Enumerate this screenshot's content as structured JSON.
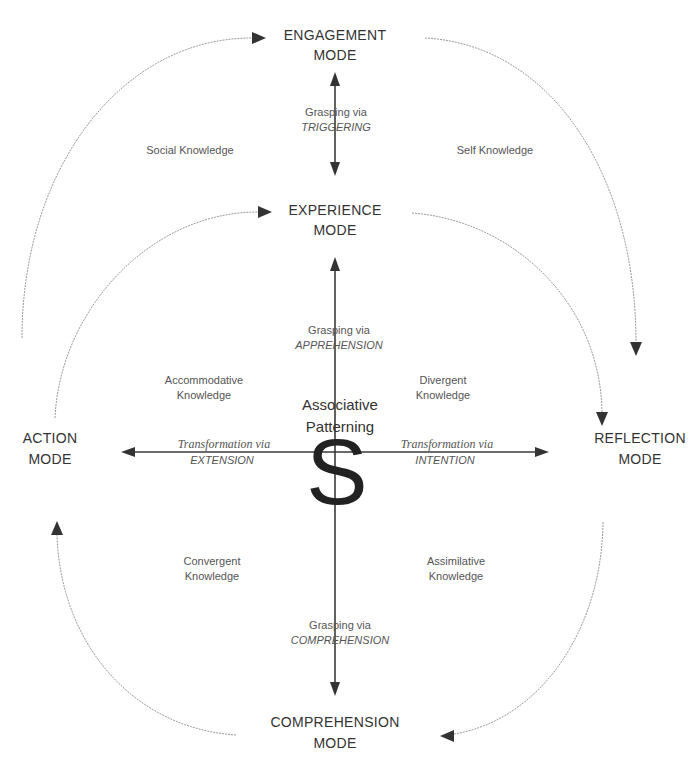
{
  "diagram": {
    "modes": {
      "engagement": [
        "ENGAGEMENT",
        "MODE"
      ],
      "experience": [
        "EXPERIENCE",
        "MODE"
      ],
      "action": [
        "ACTION",
        "MODE"
      ],
      "reflection": [
        "REFLECTION",
        "MODE"
      ],
      "comprehension": [
        "COMPREHENSION",
        "MODE"
      ]
    },
    "knowledge": {
      "social": "Social Knowledge",
      "self": "Self Knowledge",
      "accommodative": [
        "Accommodative",
        "Knowledge"
      ],
      "divergent": [
        "Divergent",
        "Knowledge"
      ],
      "convergent": [
        "Convergent",
        "Knowledge"
      ],
      "assimilative": [
        "Assimilative",
        "Knowledge"
      ]
    },
    "grasping": {
      "triggering": [
        "Grasping via",
        "TRIGGERING"
      ],
      "apprehension": [
        "Grasping via",
        "APPREHENSION"
      ],
      "comprehension": [
        "Grasping via",
        "COMPREHENSION"
      ]
    },
    "transformation": {
      "extension": [
        "Transformation via",
        "EXTENSION"
      ],
      "intention": [
        "Transformation via",
        "INTENTION"
      ]
    },
    "center": {
      "title": [
        "Associative",
        "Patterning"
      ],
      "symbol": "S"
    },
    "colors": {
      "text_dark": "#333333",
      "text_light": "#555555",
      "axis": "#3a3a3a",
      "arc": "#9a9a9a",
      "background": "#ffffff"
    }
  }
}
